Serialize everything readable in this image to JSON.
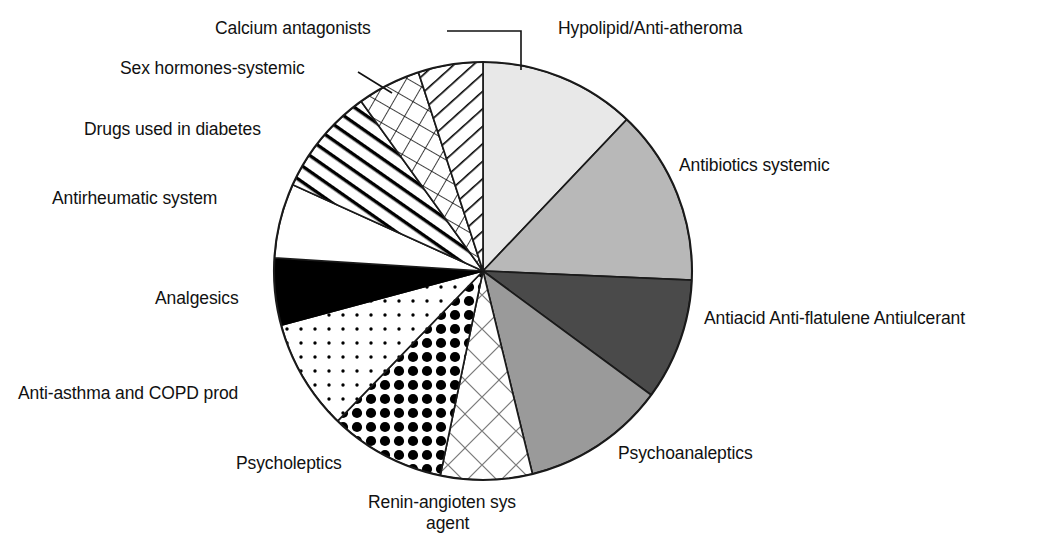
{
  "chart_data": {
    "type": "pie",
    "title": "",
    "subtitle": "",
    "xlabel": "",
    "ylabel": "",
    "legend_position": "labels-around-pie",
    "grid": false,
    "units": "share of total (%)",
    "center": {
      "x": 483,
      "y": 271
    },
    "radius": 209,
    "start_angle_deg": 0,
    "direction": "clockwise",
    "categories": [
      "Hypolipid/Anti-atheroma",
      "Antibiotics systemic",
      "Antiacid Anti-flatulene Antiulcerant",
      "Psychoanaleptics",
      "Renin-angioten sys agent",
      "Psycholeptics",
      "Anti-asthma and COPD prod",
      "Analgesics",
      "Antirheumatic system",
      "Drugs used in diabetes",
      "Sex hormones-systemic",
      "Calcium antagonists"
    ],
    "values": [
      12.1,
      13.6,
      9.4,
      11.1,
      7.1,
      9.0,
      8.6,
      5.2,
      5.8,
      8.3,
      4.9,
      4.9
    ],
    "slices": [
      {
        "label": "Hypolipid/Anti-atheroma",
        "start_deg": 0.0,
        "end_deg": 43.5,
        "value": 12.1,
        "fill": "#e8e8e8",
        "pattern": "solid"
      },
      {
        "label": "Antibiotics systemic",
        "start_deg": 43.5,
        "end_deg": 92.5,
        "value": 13.6,
        "fill": "#b8b8b8",
        "pattern": "solid"
      },
      {
        "label": "Antiacid Anti-flatulene Antiulcerant",
        "start_deg": 92.5,
        "end_deg": 126.4,
        "value": 9.4,
        "fill": "#4a4a4a",
        "pattern": "solid"
      },
      {
        "label": "Psychoanaleptics",
        "start_deg": 126.4,
        "end_deg": 166.3,
        "value": 11.1,
        "fill": "#9a9a9a",
        "pattern": "solid"
      },
      {
        "label": "Renin-angioten sys agent",
        "start_deg": 166.3,
        "end_deg": 191.8,
        "value": 7.1,
        "fill": "#ffffff",
        "pattern": "diamond-outline"
      },
      {
        "label": "Psycholeptics",
        "start_deg": 191.8,
        "end_deg": 224.1,
        "value": 9.0,
        "fill": "#ffffff",
        "pattern": "large-dots"
      },
      {
        "label": "Anti-asthma and COPD prod",
        "start_deg": 224.1,
        "end_deg": 255.0,
        "value": 8.6,
        "fill": "#ffffff",
        "pattern": "small-dots"
      },
      {
        "label": "Analgesics",
        "start_deg": 255.0,
        "end_deg": 273.6,
        "value": 5.2,
        "fill": "#000000",
        "pattern": "solid"
      },
      {
        "label": "Antirheumatic system",
        "start_deg": 273.6,
        "end_deg": 294.4,
        "value": 5.8,
        "fill": "#ffffff",
        "pattern": "plain"
      },
      {
        "label": "Drugs used in diabetes",
        "start_deg": 294.4,
        "end_deg": 324.3,
        "value": 8.3,
        "fill": "#ffffff",
        "pattern": "diagonal-lines"
      },
      {
        "label": "Sex hormones-systemic",
        "start_deg": 324.3,
        "end_deg": 342.0,
        "value": 4.9,
        "fill": "#ffffff",
        "pattern": "cross-hatch"
      },
      {
        "label": "Calcium antagonists",
        "start_deg": 342.0,
        "end_deg": 360.0,
        "value": 4.9,
        "fill": "#ffffff",
        "pattern": "hatch-right"
      }
    ],
    "annotations": [
      {
        "text": "Calcium antagonists",
        "x": 215,
        "y": 18,
        "align": "left",
        "leader": true
      },
      {
        "text": "Sex hormones-systemic",
        "x": 120,
        "y": 58,
        "align": "left",
        "leader": true
      },
      {
        "text": "Drugs used in diabetes",
        "x": 84,
        "y": 119,
        "align": "left",
        "leader": false
      },
      {
        "text": "Antirheumatic system",
        "x": 52,
        "y": 188,
        "align": "left",
        "leader": false
      },
      {
        "text": "Analgesics",
        "x": 155,
        "y": 288,
        "align": "left",
        "leader": false
      },
      {
        "text": "Anti-asthma and COPD prod",
        "x": 18,
        "y": 383,
        "align": "left",
        "leader": false
      },
      {
        "text": "Psycholeptics",
        "x": 236,
        "y": 453,
        "align": "left",
        "leader": false
      },
      {
        "text": "Renin-angioten sys",
        "x": 368,
        "y": 492,
        "align": "left",
        "leader": false
      },
      {
        "text": "agent",
        "x": 426,
        "y": 513,
        "align": "left",
        "leader": false
      },
      {
        "text": "Hypolipid/Anti-atheroma",
        "x": 558,
        "y": 18,
        "align": "left",
        "leader": false
      },
      {
        "text": "Antibiotics systemic",
        "x": 679,
        "y": 155,
        "align": "left",
        "leader": false
      },
      {
        "text": "Antiacid Anti-flatulene Antiulcerant",
        "x": 704,
        "y": 308,
        "align": "left",
        "leader": false
      },
      {
        "text": "Psychoanaleptics",
        "x": 618,
        "y": 443,
        "align": "left",
        "leader": false
      }
    ]
  },
  "labels": {
    "calcium_antagonists": "Calcium antagonists",
    "sex_hormones_systemic": "Sex hormones-systemic",
    "drugs_used_in_diabetes": "Drugs used in diabetes",
    "antirheumatic_system": "Antirheumatic system",
    "analgesics": "Analgesics",
    "anti_asthma_copd": "Anti-asthma and COPD prod",
    "psycholeptics": "Psycholeptics",
    "renin_line1": "Renin-angioten sys",
    "renin_line2": "agent",
    "hypolipid": "Hypolipid/Anti-atheroma",
    "antibiotics_systemic": "Antibiotics systemic",
    "antiacid": "Antiacid Anti-flatulene Antiulcerant",
    "psychoanaleptics": "Psychoanaleptics"
  },
  "colors": {
    "slice_light": "#e8e8e8",
    "slice_mid_light": "#b8b8b8",
    "slice_mid": "#9a9a9a",
    "slice_dark": "#4a4a4a",
    "slice_black": "#000000",
    "slice_white": "#ffffff",
    "outline": "#1a1a1a",
    "text": "#111111"
  }
}
